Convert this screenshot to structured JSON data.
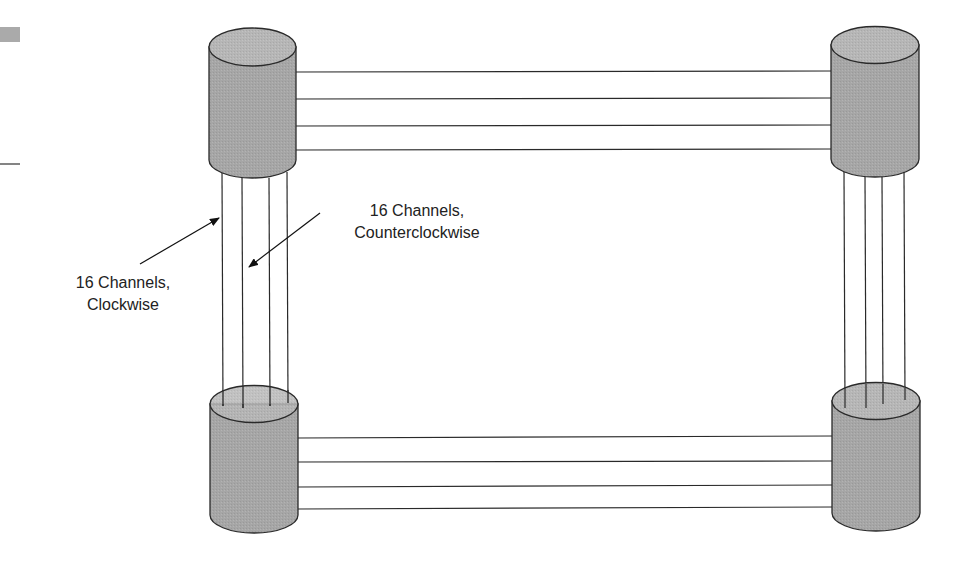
{
  "diagram": {
    "type": "bidirectional ring of four nodes",
    "nodes": [
      {
        "id": "top-left"
      },
      {
        "id": "top-right"
      },
      {
        "id": "bottom-left"
      },
      {
        "id": "bottom-right"
      }
    ],
    "links_per_side": 4,
    "labels": {
      "clockwise": {
        "line1": "16 Channels,",
        "line2": "Clockwise"
      },
      "counterclockwise": {
        "line1": "16 Channels,",
        "line2": "Counterclockwise"
      }
    },
    "colors": {
      "cylinder_fill": "#a8a8a8",
      "cylinder_top": "#b8b8b8",
      "stroke": "#2a2a2a"
    }
  }
}
